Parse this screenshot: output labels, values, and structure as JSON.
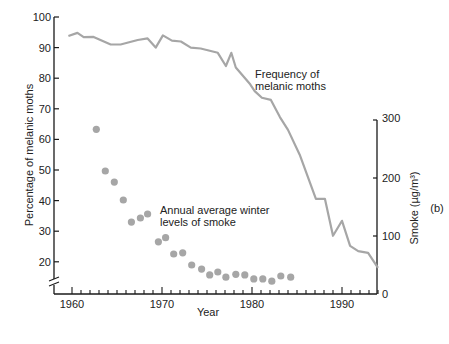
{
  "chart_data": {
    "type": "line+scatter",
    "panel_label": "(b)",
    "xlabel": "Year",
    "ylabel_left": "Percentage of melanic moths",
    "ylabel_right": "Smoke (µg/m³)",
    "x_range": [
      1958.5,
      1994.5
    ],
    "y_left_range": [
      15,
      100
    ],
    "y_right_range": [
      0,
      300
    ],
    "x_ticks": [
      1960,
      1970,
      1980,
      1990
    ],
    "y_left_ticks": [
      20,
      30,
      40,
      50,
      60,
      70,
      80,
      90,
      100
    ],
    "y_right_ticks": [
      0,
      100,
      200,
      300
    ],
    "grid": false,
    "legend": "inline annotations",
    "annotations": [
      {
        "text_lines": [
          "Frequency of",
          "melanic moths"
        ],
        "series": "melanic_frequency"
      },
      {
        "text_lines": [
          "Annual average winter",
          "levels of smoke"
        ],
        "series": "smoke"
      }
    ],
    "series": [
      {
        "name": "Frequency of melanic moths",
        "axis": "left",
        "style": "line",
        "color": "#a6a6a6",
        "x": [
          1959.6,
          1960.6,
          1961.3,
          1962.4,
          1964.3,
          1965.4,
          1967.3,
          1968.4,
          1969.3,
          1970.1,
          1971.1,
          1972.1,
          1973.2,
          1974.3,
          1976.2,
          1977.1,
          1977.7,
          1978.2,
          1979.8,
          1980.3,
          1981.1,
          1982.1,
          1983.1,
          1984.0,
          1985.3,
          1987.1,
          1988.1,
          1989.0,
          1990.0,
          1990.9,
          1991.8,
          1992.9,
          1994.0
        ],
        "y": [
          93.8,
          94.8,
          93.4,
          93.5,
          91.0,
          91.0,
          92.5,
          93.0,
          90.0,
          94.0,
          92.3,
          92.0,
          90.0,
          89.7,
          88.3,
          84.0,
          88.3,
          83.5,
          78.0,
          75.8,
          73.6,
          72.9,
          67.3,
          63.1,
          55.0,
          40.6,
          40.6,
          28.5,
          33.4,
          25.2,
          23.5,
          22.9,
          18.0
        ]
      },
      {
        "name": "Annual average winter levels of smoke",
        "axis": "right",
        "style": "scatter",
        "color": "#a6a6a6",
        "x": [
          1962.7,
          1963.7,
          1964.7,
          1965.7,
          1966.6,
          1967.6,
          1968.4,
          1969.6,
          1970.4,
          1971.3,
          1972.3,
          1973.3,
          1974.4,
          1975.3,
          1976.2,
          1977.1,
          1978.2,
          1979.2,
          1980.2,
          1981.2,
          1982.2,
          1983.2,
          1984.3
        ],
        "y": [
          284,
          212,
          193,
          162,
          124,
          131,
          138,
          90,
          97,
          69,
          71,
          50,
          43,
          33,
          38,
          29,
          34,
          33,
          26,
          26,
          22,
          31,
          29
        ]
      }
    ]
  }
}
